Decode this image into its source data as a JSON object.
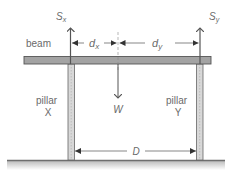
{
  "diagram": {
    "labels": {
      "beam": "beam",
      "pillar_x_line1": "pillar",
      "pillar_x_line2": "X",
      "pillar_y_line1": "pillar",
      "pillar_y_line2": "Y",
      "weight": "W",
      "force_x_main": "S",
      "force_x_sub": "x",
      "force_y_main": "S",
      "force_y_sub": "y",
      "dist_x_main": "d",
      "dist_x_sub": "x",
      "dist_y_main": "d",
      "dist_y_sub": "y",
      "span": "D"
    },
    "colors": {
      "beam_fill": "#a3a3a3",
      "stroke": "#555555",
      "text": "#6a6a6a",
      "pillar_fill": "#d8d8d8",
      "ground": "#6e6e6e"
    }
  }
}
